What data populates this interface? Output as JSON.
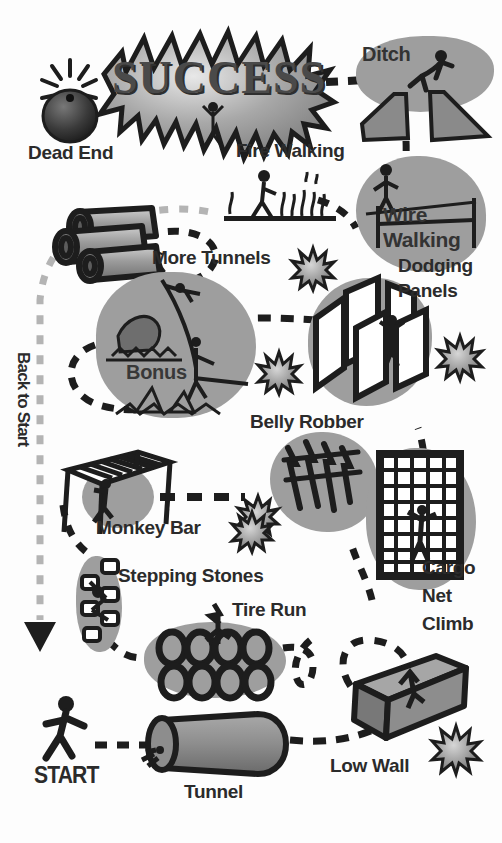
{
  "poster": {
    "title": "SUCCESS",
    "start_label": "START",
    "back_to_start_label": "Back to Start"
  },
  "palette": {
    "ink": "#1d1d1d",
    "blob_gray": "#9e9e9e",
    "light_gray": "#b9b9b9",
    "mid_gray": "#8a8a8a",
    "dark_gray": "#6b6b6b",
    "paper": "#ffffff",
    "label_ink": "#2b2b2b"
  },
  "obstacles": [
    {
      "id": "start",
      "label": "START",
      "icon": "running-person-icon"
    },
    {
      "id": "tunnel",
      "label": "Tunnel",
      "icon": "tunnel-tube-icon"
    },
    {
      "id": "low-wall",
      "label": "Low Wall",
      "icon": "low-wall-block-icon"
    },
    {
      "id": "cargo-net-climb",
      "label": "Cargo Net Climb",
      "icon": "cargo-net-grid-icon"
    },
    {
      "id": "belly-robber",
      "label": "Belly Robber",
      "icon": "barbed-wire-crawl-icon"
    },
    {
      "id": "dodging-panels",
      "label": "Dodging Panels",
      "icon": "zigzag-panels-icon"
    },
    {
      "id": "bonus",
      "label": "Bonus",
      "icon": "water-rope-gator-icon"
    },
    {
      "id": "more-tunnels",
      "label": "More Tunnels",
      "icon": "three-pipes-icon"
    },
    {
      "id": "monkey-bar",
      "label": "Monkey Bar",
      "icon": "monkey-bar-frame-icon"
    },
    {
      "id": "stepping-stones",
      "label": "Stepping Stones",
      "icon": "stepping-stones-icon"
    },
    {
      "id": "tire-run",
      "label": "Tire Run",
      "icon": "tire-grid-icon"
    },
    {
      "id": "fire-walking",
      "label": "Fire Walking",
      "icon": "fire-flames-icon"
    },
    {
      "id": "wire-walking",
      "label": "Wire Walking",
      "icon": "tightrope-icon"
    },
    {
      "id": "ditch",
      "label": "Ditch",
      "icon": "ditch-jumper-icon"
    },
    {
      "id": "dead-end",
      "label": "Dead End",
      "icon": "bomb-icon"
    }
  ],
  "labels": {
    "dead_end": "Dead End",
    "fire_walking": "Fire Walking",
    "ditch": "Ditch",
    "wire_walking_line1": "Wire",
    "wire_walking_line2": "Walking",
    "dodging_line1": "Dodging",
    "dodging_line2": "Panels",
    "more_tunnels": "More Tunnels",
    "bonus": "Bonus",
    "belly_robber": "Belly Robber",
    "monkey_bar": "Monkey Bar",
    "stepping_stones": "Stepping Stones",
    "tire_run": "Tire Run",
    "cargo_line1": "Cargo",
    "cargo_line2": "Net",
    "cargo_line3": "Climb",
    "low_wall": "Low Wall",
    "tunnel": "Tunnel",
    "start": "START",
    "back_to_start": "Back to Start",
    "success": "SUCCESS"
  },
  "counts": {
    "tires_top_row": 4,
    "tires_bottom_row": 4,
    "pipes": 3,
    "stars": 7,
    "stepping_stones": 6
  }
}
